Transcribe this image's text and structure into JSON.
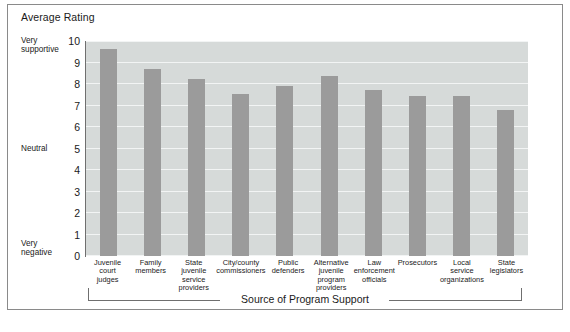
{
  "figure": {
    "title": "Average Rating",
    "caption": ""
  },
  "axes": {
    "y": {
      "ticks": [
        "10",
        "9",
        "8",
        "7",
        "6",
        "5",
        "4",
        "3",
        "2",
        "1",
        "0"
      ],
      "anchors": {
        "top_line1": "Very",
        "top_line2": "supportive",
        "middle": "Neutral",
        "bottom_line1": "Very",
        "bottom_line2": "negative"
      }
    },
    "x": {
      "bracket_label": "Source of Program Support"
    }
  },
  "chart_data": {
    "type": "bar",
    "title": "Average Rating",
    "xlabel": "Source of Program Support",
    "ylabel": "Average Rating",
    "ylim": [
      0,
      10
    ],
    "grid": true,
    "legend": "none",
    "y_tick_labels": [
      "0",
      "1",
      "2",
      "3",
      "4",
      "5",
      "6",
      "7",
      "8",
      "9",
      "10"
    ],
    "y_anchor_labels": {
      "10": "Very supportive",
      "5": "Neutral",
      "0": "Very negative"
    },
    "bar_color": "#9b9b9b",
    "plot_background": "#d6dad9",
    "gridline_color": "#f2f4f4",
    "categories": [
      "Juvenile court judges",
      "Family members",
      "State juvenile service providers",
      "City/county commissioners",
      "Public defenders",
      "Alternative juvenile program providers",
      "Law enforcement officials",
      "Prosecutors",
      "Local service organizations",
      "State legislators"
    ],
    "category_lines": [
      [
        "Juvenile",
        "court",
        "judges"
      ],
      [
        "Family",
        "members"
      ],
      [
        "State",
        "juvenile",
        "service",
        "providers"
      ],
      [
        "City/county",
        "commissioners"
      ],
      [
        "Public",
        "defenders"
      ],
      [
        "Alternative",
        "juvenile",
        "program",
        "providers"
      ],
      [
        "Law",
        "enforcement",
        "officials"
      ],
      [
        "Prosecutors"
      ],
      [
        "Local",
        "service",
        "organizations"
      ],
      [
        "State",
        "legislators"
      ]
    ],
    "values": [
      9.65,
      8.7,
      8.25,
      7.55,
      7.9,
      8.35,
      7.7,
      7.45,
      7.45,
      6.8
    ]
  }
}
